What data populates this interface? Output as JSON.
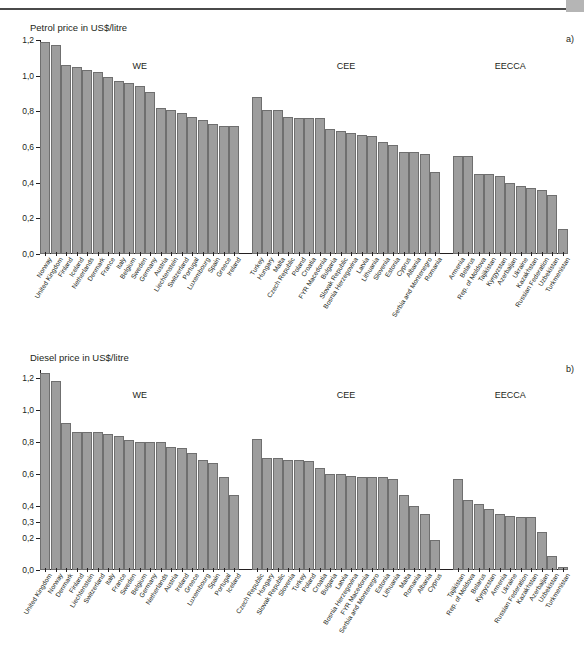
{
  "page": {
    "corner_marker": "",
    "panel_a_letter": "a)",
    "panel_b_letter": "b)"
  },
  "chart_data": [
    {
      "id": "petrol",
      "type": "bar",
      "title": "Petrol price in US$/litre",
      "xlabel": "",
      "ylabel": "",
      "ylim": [
        0,
        1.2
      ],
      "yticks": [
        0.0,
        0.2,
        0.4,
        0.6,
        0.8,
        1.0,
        1.2
      ],
      "ytick_labels": [
        "0,0",
        "0,2",
        "0,4",
        "0,6",
        "0,8",
        "1,0",
        "1,2"
      ],
      "grid": false,
      "legend": "none",
      "group_labels": [
        "WE",
        "CEE",
        "EECCA"
      ],
      "groups": [
        {
          "name": "WE",
          "categories": [
            "Norway",
            "United Kingdom",
            "Finland",
            "Iceland",
            "Netherlands",
            "Denmark",
            "France",
            "Italy",
            "Belgium",
            "Sweden",
            "Germany",
            "Austria",
            "Liechtenstein",
            "Switzerland",
            "Portugal",
            "Luxembourg",
            "Spain",
            "Greece",
            "Ireland"
          ],
          "values": [
            1.19,
            1.17,
            1.06,
            1.05,
            1.03,
            1.02,
            0.99,
            0.97,
            0.96,
            0.94,
            0.91,
            0.82,
            0.81,
            0.79,
            0.77,
            0.75,
            0.73,
            0.72,
            0.72
          ]
        },
        {
          "name": "CEE",
          "categories": [
            "Turkey",
            "Hungary",
            "Malta",
            "Czech Republic",
            "Poland",
            "Croatia",
            "FYR Macedonia",
            "Bulgaria",
            "Slovak Republic",
            "Bosnia Herzegovina",
            "Latvia",
            "Lithuania",
            "Slovenia",
            "Estonia",
            "Cyprus",
            "Albania",
            "Serbia and Montenegro",
            "Romania"
          ],
          "values": [
            0.88,
            0.81,
            0.81,
            0.77,
            0.76,
            0.76,
            0.76,
            0.7,
            0.69,
            0.68,
            0.67,
            0.66,
            0.63,
            0.61,
            0.57,
            0.57,
            0.56,
            0.46
          ]
        },
        {
          "name": "EECCA",
          "categories": [
            "Armenia",
            "Belarus",
            "Rep. of Moldova",
            "Tajikistan",
            "Kyrgyzstan",
            "Azerbaijan",
            "Ukraine",
            "Kazakhstan",
            "Russian Federation",
            "Uzbekistan",
            "Turkmenistan"
          ],
          "values": [
            0.55,
            0.55,
            0.45,
            0.45,
            0.44,
            0.4,
            0.38,
            0.37,
            0.36,
            0.33,
            0.14
          ]
        }
      ]
    },
    {
      "id": "diesel",
      "type": "bar",
      "title": "Diesel price in US$/litre",
      "xlabel": "",
      "ylabel": "",
      "ylim": [
        0,
        1.25
      ],
      "yticks": [
        0.0,
        0.2,
        0.3,
        0.4,
        0.6,
        0.8,
        1.0,
        1.2
      ],
      "ytick_labels": [
        "0,0",
        "0,2",
        "0,3",
        "0,4",
        "0,6",
        "0,8",
        "1,0",
        "1,2"
      ],
      "grid": false,
      "legend": "none",
      "group_labels": [
        "WE",
        "CEE",
        "EECCA"
      ],
      "groups": [
        {
          "name": "WE",
          "categories": [
            "United Kingdom",
            "Norway",
            "Denmark",
            "Finland",
            "Liechtenstein",
            "Switzerland",
            "Italy",
            "France",
            "Sweden",
            "Belgium",
            "Germany",
            "Netherlands",
            "Austria",
            "Ireland",
            "Greece",
            "Luxembourg",
            "Spain",
            "Portugal",
            "Iceland"
          ],
          "values": [
            1.23,
            1.18,
            0.92,
            0.86,
            0.86,
            0.86,
            0.85,
            0.84,
            0.81,
            0.8,
            0.8,
            0.8,
            0.77,
            0.76,
            0.73,
            0.69,
            0.67,
            0.58,
            0.47
          ]
        },
        {
          "name": "CEE",
          "categories": [
            "Czech Republic",
            "Hungary",
            "Slovak Republic",
            "Slovenia",
            "Turkey",
            "Poland",
            "Croatia",
            "Bulgaria",
            "Latvia",
            "Bosnia Herzegovina",
            "FYR Macedonia",
            "Serbia and Montenegro",
            "Estonia",
            "Lithuania",
            "Malta",
            "Romania",
            "Albania",
            "Cyprus"
          ],
          "values": [
            0.82,
            0.7,
            0.7,
            0.69,
            0.69,
            0.68,
            0.64,
            0.6,
            0.6,
            0.59,
            0.58,
            0.58,
            0.58,
            0.57,
            0.47,
            0.4,
            0.35,
            0.19
          ]
        },
        {
          "name": "EECCA",
          "categories": [
            "Tajikistan",
            "Rep. of Moldova",
            "Belarus",
            "Kyrgyzstan",
            "Armenia",
            "Ukraine",
            "Russian Federation",
            "Kazakhstan",
            "Azerbaijan",
            "Uzbekistan",
            "Turkmenistan"
          ],
          "values": [
            0.57,
            0.44,
            0.41,
            0.38,
            0.35,
            0.34,
            0.33,
            0.33,
            0.24,
            0.09,
            0.02
          ]
        }
      ]
    }
  ]
}
